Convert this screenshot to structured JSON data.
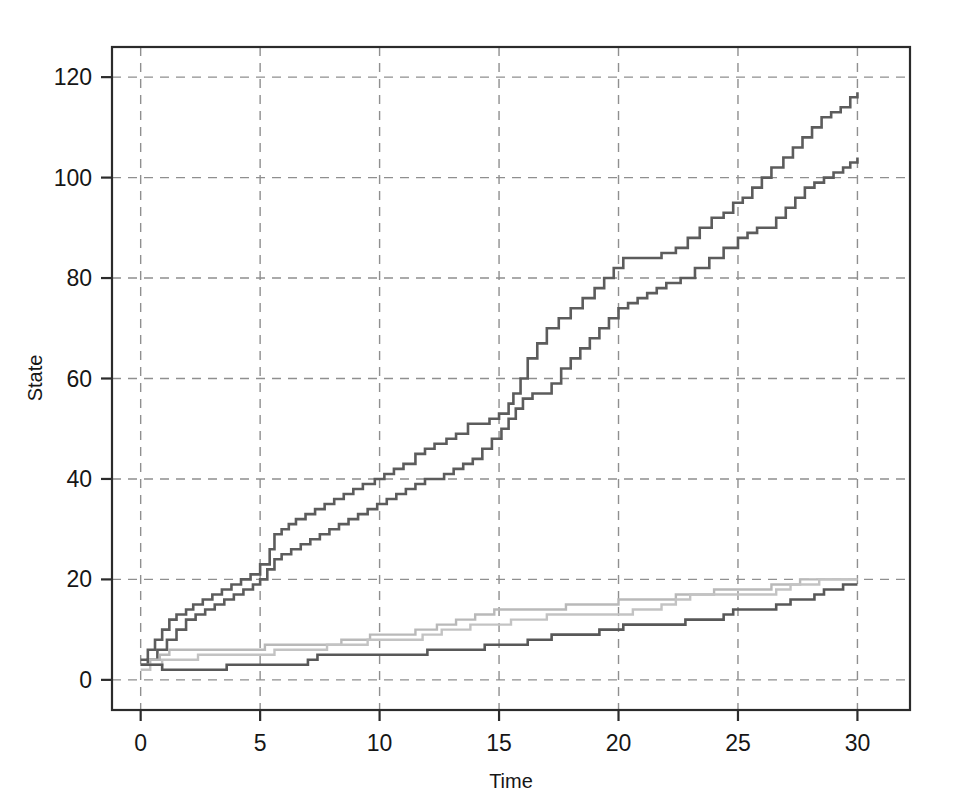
{
  "chart_data": {
    "type": "line",
    "subtype": "step-post",
    "title": "",
    "xlabel": "Time",
    "ylabel": "State",
    "xlim": [
      -1.2,
      32.2
    ],
    "ylim": [
      -6,
      126
    ],
    "xticks": [
      0,
      5,
      10,
      15,
      20,
      25,
      30
    ],
    "xtick_labels": [
      "0",
      "5",
      "10",
      "15",
      "20",
      "25",
      "30"
    ],
    "yticks": [
      0,
      20,
      40,
      60,
      80,
      100,
      120
    ],
    "ytick_labels": [
      "0",
      "20",
      "40",
      "60",
      "80",
      "100",
      "120"
    ],
    "grid": true,
    "grid_style": "dashed",
    "grid_color": "#8f8f8f",
    "legend": "none",
    "background": "#ffffff",
    "axis_color": "#2b2b2b",
    "series": [
      {
        "name": "upper-dark-1",
        "color": "#5c5c5c",
        "width": 2.6,
        "x": [
          0,
          0.3,
          0.6,
          0.9,
          1.2,
          1.5,
          1.9,
          2.2,
          2.6,
          3.0,
          3.4,
          3.8,
          4.2,
          4.6,
          5.0,
          5.4,
          5.6,
          5.9,
          6.2,
          6.5,
          6.9,
          7.3,
          7.7,
          8.1,
          8.5,
          8.9,
          9.3,
          9.8,
          10.2,
          10.6,
          11.0,
          11.5,
          11.9,
          12.3,
          12.8,
          13.2,
          13.7,
          14.1,
          14.6,
          15.0,
          15.4,
          15.6,
          15.9,
          16.2,
          16.6,
          17.0,
          17.5,
          18.0,
          18.5,
          19.0,
          19.4,
          19.8,
          20.2,
          21.0,
          21.8,
          22.4,
          22.9,
          23.4,
          23.9,
          24.4,
          24.8,
          25.2,
          25.6,
          26.0,
          26.4,
          26.9,
          27.3,
          27.7,
          28.1,
          28.5,
          28.9,
          29.3,
          29.7,
          30.0
        ],
        "y": [
          4,
          6,
          8,
          10,
          12,
          13,
          14,
          15,
          16,
          17,
          18,
          19,
          20,
          21,
          23,
          26,
          29,
          30,
          31,
          32,
          33,
          34,
          35,
          36,
          37,
          38,
          39,
          40,
          41,
          42,
          43,
          45,
          46,
          47,
          48,
          49,
          51,
          51,
          52,
          53,
          55,
          57,
          60,
          64,
          67,
          70,
          72,
          74,
          76,
          78,
          80,
          82,
          84,
          84,
          85,
          86,
          88,
          90,
          92,
          93,
          95,
          96,
          98,
          100,
          102,
          104,
          106,
          108,
          110,
          112,
          113,
          114,
          116,
          117
        ]
      },
      {
        "name": "upper-dark-2",
        "color": "#5c5c5c",
        "width": 2.6,
        "x": [
          0,
          0.3,
          0.7,
          1.1,
          1.5,
          1.9,
          2.3,
          2.7,
          3.1,
          3.5,
          3.9,
          4.3,
          4.7,
          5.0,
          5.3,
          5.6,
          5.9,
          6.3,
          6.7,
          7.1,
          7.5,
          7.9,
          8.3,
          8.7,
          9.1,
          9.5,
          9.9,
          10.3,
          10.7,
          11.1,
          11.5,
          11.9,
          12.3,
          12.7,
          13.1,
          13.5,
          13.9,
          14.3,
          14.7,
          15.1,
          15.4,
          15.7,
          16.0,
          16.4,
          16.8,
          17.2,
          17.6,
          18.0,
          18.4,
          18.8,
          19.2,
          19.6,
          20.0,
          20.4,
          20.8,
          21.2,
          21.6,
          22.0,
          22.6,
          23.2,
          23.8,
          24.4,
          25.0,
          25.4,
          25.8,
          26.2,
          26.6,
          27.0,
          27.4,
          27.8,
          28.2,
          28.6,
          29.0,
          29.4,
          29.7,
          30.0
        ],
        "y": [
          3,
          4,
          6,
          8,
          10,
          12,
          13,
          14,
          15,
          16,
          17,
          18,
          19,
          20,
          22,
          24,
          25,
          26,
          27,
          28,
          29,
          30,
          31,
          32,
          33,
          34,
          35,
          36,
          37,
          38,
          39,
          40,
          40,
          41,
          42,
          43,
          44,
          46,
          48,
          50,
          52,
          54,
          56,
          57,
          57,
          59,
          62,
          64,
          66,
          68,
          70,
          72,
          74,
          75,
          76,
          77,
          78,
          79,
          80,
          82,
          84,
          86,
          88,
          89,
          90,
          90,
          92,
          94,
          96,
          98,
          99,
          100,
          101,
          102,
          103,
          104
        ]
      },
      {
        "name": "lower-light-1",
        "color": "#b9b9b9",
        "width": 2.4,
        "x": [
          0,
          0.4,
          0.8,
          1.2,
          1.6,
          2.0,
          2.5,
          3.0,
          3.5,
          4.0,
          4.4,
          4.8,
          5.2,
          5.6,
          6.0,
          6.6,
          7.2,
          7.8,
          8.4,
          9.0,
          9.6,
          10.0,
          10.5,
          11.0,
          11.5,
          12.0,
          12.4,
          12.8,
          13.2,
          13.6,
          14.0,
          14.4,
          14.8,
          15.2,
          15.6,
          16.0,
          16.6,
          17.2,
          17.8,
          18.4,
          19.0,
          19.6,
          20.0,
          20.6,
          21.2,
          21.8,
          22.4,
          23.0,
          23.5,
          24.0,
          24.6,
          25.2,
          25.8,
          26.4,
          27.0,
          27.6,
          28.2,
          28.8,
          29.4,
          30.0
        ],
        "y": [
          3,
          4,
          5,
          6,
          6,
          6,
          6,
          6,
          6,
          6,
          6,
          6,
          7,
          7,
          7,
          7,
          7,
          7,
          8,
          8,
          9,
          9,
          9,
          9,
          10,
          10,
          11,
          11,
          12,
          12,
          13,
          13,
          14,
          14,
          14,
          14,
          14,
          14,
          15,
          15,
          15,
          15,
          16,
          16,
          16,
          16,
          17,
          17,
          17,
          18,
          18,
          18,
          18,
          19,
          19,
          20,
          20,
          20,
          20,
          20
        ]
      },
      {
        "name": "lower-light-2",
        "color": "#c3c3c3",
        "width": 2.4,
        "x": [
          0,
          0.4,
          0.9,
          1.4,
          1.9,
          2.4,
          3.0,
          3.6,
          4.2,
          4.8,
          5.2,
          5.6,
          6.0,
          6.6,
          7.2,
          7.8,
          8.4,
          9.0,
          9.5,
          10.0,
          10.5,
          11.0,
          11.4,
          11.8,
          12.2,
          12.6,
          13.0,
          13.4,
          13.8,
          14.2,
          14.6,
          15.0,
          15.5,
          16.0,
          16.5,
          17.0,
          17.6,
          18.2,
          18.8,
          19.4,
          20.0,
          20.6,
          21.2,
          21.8,
          22.4,
          23.0,
          23.6,
          24.2,
          24.8,
          25.4,
          26.0,
          26.6,
          27.2,
          27.8,
          28.4,
          29.0,
          29.5,
          30.0
        ],
        "y": [
          2,
          3,
          4,
          4,
          4,
          5,
          5,
          5,
          5,
          5,
          5,
          6,
          6,
          6,
          6,
          7,
          7,
          7,
          8,
          8,
          8,
          8,
          8,
          9,
          9,
          10,
          10,
          10,
          11,
          11,
          11,
          11,
          12,
          12,
          12,
          13,
          13,
          13,
          13,
          13,
          13,
          14,
          14,
          15,
          16,
          17,
          17,
          17,
          17,
          17,
          17,
          18,
          19,
          19,
          20,
          20,
          20,
          20
        ]
      },
      {
        "name": "lower-dark",
        "color": "#585858",
        "width": 2.6,
        "x": [
          0,
          0.4,
          0.9,
          1.3,
          1.8,
          2.4,
          3.0,
          3.6,
          4.2,
          4.8,
          5.4,
          6.0,
          6.6,
          7.0,
          7.4,
          7.8,
          8.4,
          9.0,
          9.6,
          10.2,
          10.8,
          11.4,
          12.0,
          12.6,
          13.2,
          13.8,
          14.4,
          15.0,
          15.6,
          16.2,
          16.8,
          17.2,
          17.6,
          18.0,
          18.6,
          19.2,
          19.8,
          20.2,
          20.6,
          21.0,
          21.6,
          22.2,
          22.8,
          23.4,
          24.0,
          24.4,
          24.8,
          25.4,
          26.0,
          26.6,
          27.2,
          27.8,
          28.2,
          28.6,
          29.0,
          29.4,
          29.7,
          30.0
        ],
        "y": [
          3,
          3,
          2,
          2,
          2,
          2,
          2,
          3,
          3,
          3,
          3,
          3,
          3,
          4,
          5,
          5,
          5,
          5,
          5,
          5,
          5,
          5,
          6,
          6,
          6,
          6,
          7,
          7,
          7,
          8,
          8,
          9,
          9,
          9,
          9,
          10,
          10,
          11,
          11,
          11,
          11,
          11,
          12,
          12,
          12,
          13,
          14,
          14,
          14,
          15,
          16,
          16,
          17,
          18,
          18,
          19,
          19,
          19
        ]
      }
    ]
  }
}
